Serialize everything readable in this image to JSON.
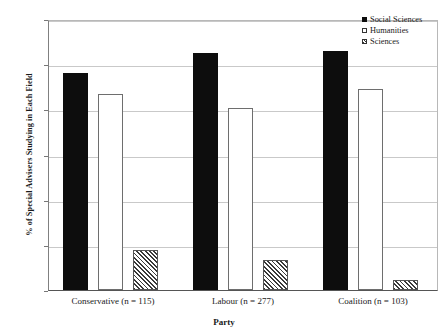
{
  "chart_data": {
    "type": "bar",
    "title": "",
    "subtitle": "",
    "xlabel": "Party",
    "ylabel": "% of Special Advisers Studying in Each Field",
    "categories": [
      "Conservative (n = 115)",
      "Labour (n = 277)",
      "Coalition (n = 103)"
    ],
    "series": [
      {
        "name": "Social Sciences",
        "values": [
          48.0,
          52.5,
          53.0
        ],
        "style": "solid-black",
        "color": "#0d0d0d"
      },
      {
        "name": "Humanities",
        "values": [
          43.4,
          40.3,
          44.5
        ],
        "style": "open-white",
        "color": "#ffffff"
      },
      {
        "name": "Sciences",
        "values": [
          8.8,
          6.7,
          2.2
        ],
        "style": "hatched",
        "color": "#3a3a3a"
      }
    ],
    "ylim": [
      0,
      60
    ],
    "yticks": [
      0,
      10,
      20,
      30,
      40,
      50,
      60
    ],
    "ytick_labels": [
      "0",
      "10",
      "20",
      "30",
      "40",
      "50",
      "60"
    ],
    "grid": "horizontal",
    "legend_position": "top-right"
  },
  "legend": {
    "items": [
      {
        "label": "Social Sciences",
        "marker": "filled-square-icon"
      },
      {
        "label": "Humanities",
        "marker": "open-square-icon"
      },
      {
        "label": "Sciences",
        "marker": "hatched-square-icon"
      }
    ]
  }
}
